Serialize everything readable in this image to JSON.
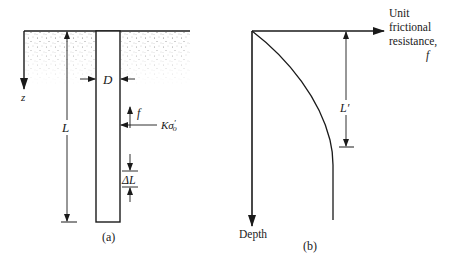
{
  "figure_a": {
    "caption": "(a)",
    "labels": {
      "z_axis": "z",
      "pile_diameter": "D",
      "pile_length": "L",
      "friction": "f",
      "lateral_stress_K": "Kσ",
      "lateral_stress_sup": "′",
      "lateral_stress_sub": "o",
      "segment_delta": "ΔL"
    }
  },
  "figure_b": {
    "caption": "(b)",
    "x_axis_label_lines": [
      "Unit",
      "frictional",
      "resistance,",
      "f"
    ],
    "y_axis_label": "Depth",
    "critical_depth_label": "L′"
  },
  "colors": {
    "ink": "#1a1a1a",
    "soil_dots": "#555555",
    "background": "#ffffff"
  }
}
